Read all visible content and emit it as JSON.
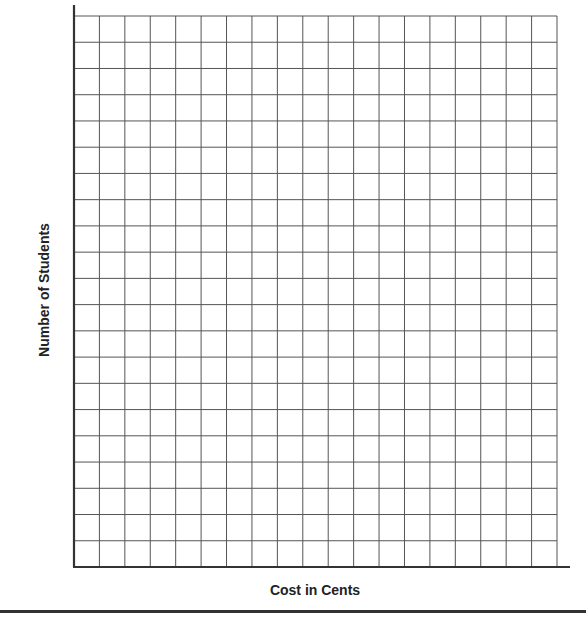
{
  "chart_data": {
    "type": "bar",
    "title": "",
    "xlabel": "Cost in Cents",
    "ylabel": "Number of Students",
    "categories": [],
    "values": [],
    "grid": true,
    "grid_columns": 19,
    "grid_rows": 21,
    "ylim": [
      0,
      21
    ],
    "legend": null,
    "note": "Blank grid for student to complete; no data plotted"
  },
  "labels": {
    "x_axis": "Cost in Cents",
    "y_axis": "Number of Students"
  },
  "colors": {
    "grid_line": "#555555",
    "axis_line": "#333333"
  }
}
